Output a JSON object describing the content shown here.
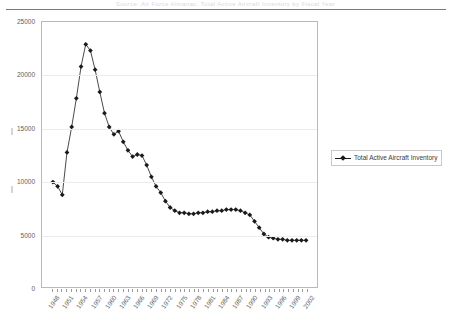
{
  "page": {
    "header_ghost_text": "Source: Air Force Almanac, Total Active Aircraft Inventory by Fiscal Year"
  },
  "legend": {
    "position": "right",
    "entries": [
      {
        "label": "Total Active Aircraft Inventory",
        "color": "#1a1a1a",
        "marker": "diamond"
      }
    ]
  },
  "chart_data": {
    "type": "line",
    "title": "",
    "subtitle": "",
    "xlabel": "",
    "ylabel": "",
    "grid": true,
    "legend_position": "right",
    "ylim": [
      0,
      25000
    ],
    "ytick_labels": [
      "0",
      "5000",
      "10000",
      "15000",
      "20000",
      "25000"
    ],
    "ytick_values": [
      0,
      5000,
      10000,
      15000,
      20000,
      25000
    ],
    "xtick_labels": [
      "1948",
      "1951",
      "1954",
      "1957",
      "1960",
      "1963",
      "1966",
      "1969",
      "1972",
      "1975",
      "1978",
      "1981",
      "1984",
      "1987",
      "1990",
      "1993",
      "1996",
      "1999",
      "2002"
    ],
    "xtick_step_years": 3,
    "series": [
      {
        "name": "Total Active Aircraft Inventory",
        "color": "#1a1a1a",
        "marker": "diamond",
        "x": [
          1948,
          1949,
          1950,
          1951,
          1952,
          1953,
          1954,
          1955,
          1956,
          1957,
          1958,
          1959,
          1960,
          1961,
          1962,
          1963,
          1964,
          1965,
          1966,
          1967,
          1968,
          1969,
          1970,
          1971,
          1972,
          1973,
          1974,
          1975,
          1976,
          1977,
          1978,
          1979,
          1980,
          1981,
          1982,
          1983,
          1984,
          1985,
          1986,
          1987,
          1988,
          1989,
          1990,
          1991,
          1992,
          1993,
          1994,
          1995,
          1996,
          1997,
          1998,
          1999,
          2000,
          2001,
          2002
        ],
        "values": [
          9900,
          9500,
          8700,
          12700,
          15100,
          17800,
          20800,
          22900,
          22300,
          20500,
          18400,
          16400,
          15100,
          14400,
          14700,
          13700,
          12900,
          12300,
          12500,
          12400,
          11500,
          10400,
          9500,
          8900,
          8100,
          7500,
          7200,
          7000,
          7000,
          6900,
          6900,
          7000,
          7000,
          7100,
          7100,
          7200,
          7200,
          7300,
          7300,
          7300,
          7200,
          7000,
          6800,
          6200,
          5600,
          5000,
          4700,
          4600,
          4500,
          4500,
          4400,
          4400,
          4400,
          4400,
          4400
        ]
      }
    ]
  }
}
